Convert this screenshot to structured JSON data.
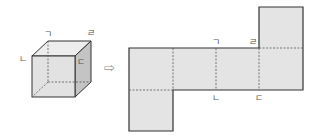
{
  "diagram": {
    "type": "cube-net",
    "cube": {
      "labels": {
        "top_back_left": "ㄱ",
        "top_front_left": "ㄴ",
        "top_front_right": "ㄷ",
        "top_back_right": "ㄹ"
      }
    },
    "arrow": "⇨",
    "net": {
      "faces": 6,
      "labels": {
        "top_a": "ㄱ",
        "top_b": "ㄹ",
        "bottom_a": "ㄴ",
        "bottom_b": "ㄷ"
      }
    },
    "colors": {
      "face": "#e4e4e4",
      "side_face": "#c8c8c8",
      "top_face": "#ececec",
      "edge": "#333333",
      "hidden": "#555555"
    }
  }
}
